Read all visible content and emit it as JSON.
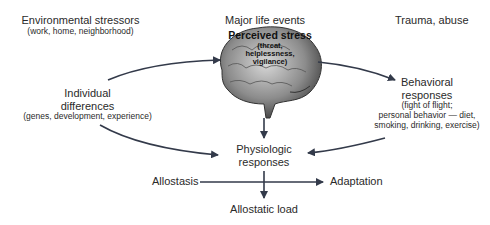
{
  "diagram": {
    "stressors": {
      "environmental": {
        "title": "Environmental stressors",
        "detail": "(work, home, neighborhood)"
      },
      "major_life_events": {
        "title": "Major life events"
      },
      "trauma": {
        "title": "Trauma, abuse"
      }
    },
    "center": {
      "title": "Perceived stress",
      "detail_1": "(threat,",
      "detail_2": "helplessness,",
      "detail_3": "vigilance)",
      "icon": "brain-icon"
    },
    "individual_differences": {
      "title_1": "Individual",
      "title_2": "differences",
      "detail": "(genes, development, experience)"
    },
    "behavioral_responses": {
      "title_1": "Behavioral",
      "title_2": "responses",
      "detail_1": "(fight of flight;",
      "detail_2": "personal behavior — diet,",
      "detail_3": "smoking, drinking, exercise)"
    },
    "physiologic_responses": {
      "title_1": "Physiologic",
      "title_2": "responses"
    },
    "allostasis": {
      "title": "Allostasis"
    },
    "adaptation": {
      "title": "Adaptation"
    },
    "allostatic_load": {
      "title": "Allostatic load"
    },
    "colors": {
      "arrow": "#333a4a",
      "text": "#2a2a2a",
      "brain": "#7a7a7a"
    }
  }
}
